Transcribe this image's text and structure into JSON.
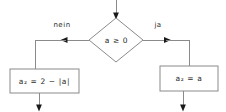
{
  "diagram": {
    "type": "flowchart",
    "title": "",
    "colors": {
      "stroke": "#8a8a8a",
      "arrow": "#1a1a1a",
      "text": "#2b2b2b",
      "background": "#ffffff"
    },
    "decision": {
      "id": "decision-a-ge-0",
      "shape": "diamond",
      "text_full": "a ≥ 0",
      "var": "a",
      "operator": "≥",
      "value": "0"
    },
    "branches": [
      {
        "id": "branch-no",
        "label": "nein",
        "direction": "left",
        "target": "process-left"
      },
      {
        "id": "branch-yes",
        "label": "ja",
        "direction": "right",
        "target": "process-right"
      }
    ],
    "processes": [
      {
        "id": "process-left",
        "shape": "rectangle",
        "text_full": "a₂ = 2 − |a|",
        "lhs_var": "a",
        "lhs_sub": "2",
        "equals": "=",
        "rhs": "2 − |a|"
      },
      {
        "id": "process-right",
        "shape": "rectangle",
        "text_full": "a₂ = a",
        "lhs_var": "a",
        "lhs_sub": "2",
        "equals": "=",
        "rhs": "a"
      }
    ],
    "connectors": [
      {
        "id": "entry-top",
        "from": "top-edge",
        "to": "decision-a-ge-0",
        "arrow": "down"
      },
      {
        "id": "no-to-left",
        "from": "decision-a-ge-0",
        "to": "process-left",
        "arrow": "left-then-down"
      },
      {
        "id": "yes-to-right",
        "from": "decision-a-ge-0",
        "to": "process-right",
        "arrow": "right-then-down"
      },
      {
        "id": "exit-left",
        "from": "process-left",
        "to": "bottom-edge",
        "arrow": "down"
      },
      {
        "id": "exit-right",
        "from": "process-right",
        "to": "bottom-edge",
        "arrow": "down"
      }
    ]
  }
}
